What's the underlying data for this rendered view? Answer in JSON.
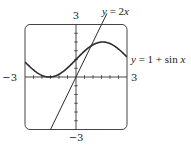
{
  "chart_data": {
    "type": "line",
    "title": "",
    "xlabel": "",
    "ylabel": "",
    "xlim": [
      -3,
      3
    ],
    "ylim": [
      -3,
      3
    ],
    "grid": false,
    "tick_spacing": 0.5,
    "tick_labels": {
      "x_min": "−3",
      "x_max": "3",
      "y_min": "−3",
      "y_max": "3"
    },
    "series": [
      {
        "name": "y = 2x",
        "label_lhs": "y",
        "label_rhs": "= 2",
        "label_var": "x",
        "x": [
          -1.5,
          -1,
          0,
          1,
          1.5
        ],
        "y": [
          -3,
          -2,
          0,
          2,
          3
        ]
      },
      {
        "name": "y = 1 + sin x",
        "label_lhs": "y",
        "label_rhs": "= 1 + sin",
        "label_var": "x",
        "x": [
          -3,
          -2.5,
          -2,
          -1.5708,
          -1,
          -0.5,
          0,
          0.5,
          1,
          1.5708,
          2,
          2.5,
          3
        ],
        "y": [
          0.859,
          0.402,
          0.091,
          0,
          0.159,
          0.521,
          1,
          1.479,
          1.841,
          2,
          1.909,
          1.598,
          1.141
        ]
      }
    ],
    "annotations": [
      {
        "text": "y = 2x",
        "position": "top, right of line"
      },
      {
        "text": "y = 1 + sin x",
        "position": "right of box"
      }
    ]
  },
  "colors": {
    "curve": "#2b2b2b",
    "axes": "#333333",
    "frame": "#444444"
  }
}
